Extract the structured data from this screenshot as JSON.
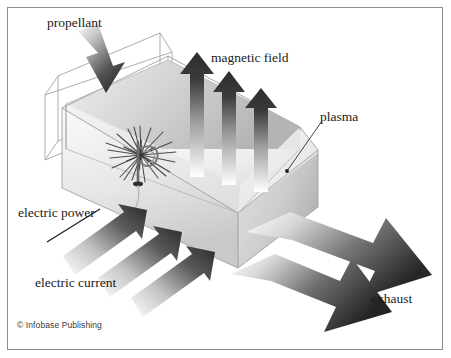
{
  "figure": {
    "background_color": "#ffffff",
    "border_color": "#8d8d8f"
  },
  "labels": {
    "propellant": "propellant",
    "magnetic_field": "magnetic field",
    "plasma": "plasma",
    "electric_power": "electric power",
    "electric_current": "electric current",
    "exhaust": "exhaust"
  },
  "credit": {
    "text": "© Infobase Publishing"
  },
  "colors": {
    "arrow_dark": "#3b3b3b",
    "arrow_light": "#ffffff",
    "chamber_light": "#f2f2f2",
    "chamber_mid": "#d9d9d9",
    "chamber_dark": "#a8a8a8",
    "outline": "#9a9a9a",
    "text": "#1b1b1b"
  },
  "elements": {
    "chamber": "open-top rectangular plasma chamber in isometric view",
    "electrode": "cathode rod with spark burst and coil at chamber floor",
    "magnetic_field_arrows": 3,
    "electric_current_arrows": 3,
    "exhaust_arrows": 2,
    "propellant_arrows": 1
  }
}
